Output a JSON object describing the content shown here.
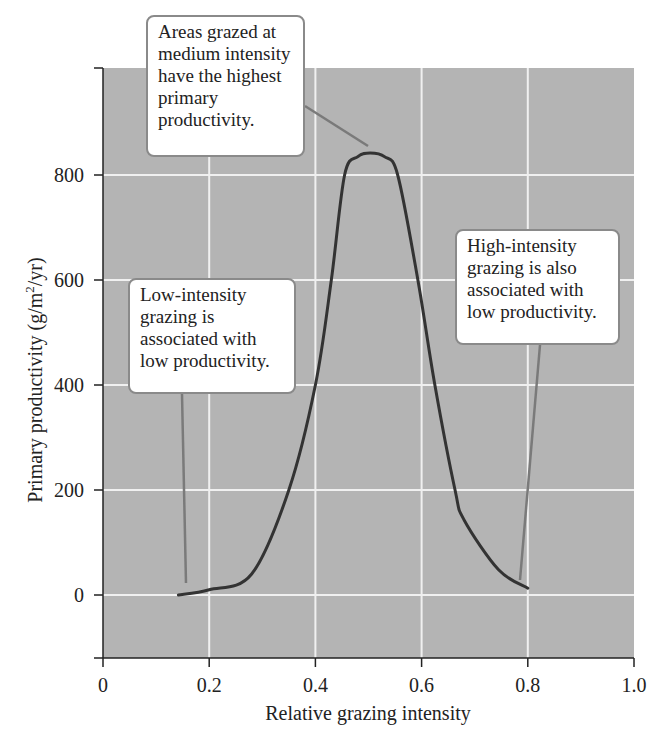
{
  "chart_data": {
    "type": "line",
    "title": "",
    "xlabel": "Relative grazing intensity",
    "ylabel": "Primary productivity (g/m²/yr)",
    "xlim": [
      0,
      1.0
    ],
    "ylim": [
      -120,
      1000
    ],
    "x_ticks": [
      "0",
      "0.2",
      "0.4",
      "0.6",
      "0.8",
      "1.0"
    ],
    "y_ticks": [
      "0",
      "200",
      "400",
      "600",
      "800"
    ],
    "grid": true,
    "background_color": "#b4b4b4",
    "grid_color": "#f0f0f0",
    "line_color": "#333333",
    "series": [
      {
        "name": "Primary productivity",
        "x": [
          0.142,
          0.2,
          0.28,
          0.35,
          0.4,
          0.43,
          0.455,
          0.48,
          0.503,
          0.53,
          0.555,
          0.593,
          0.625,
          0.663,
          0.68,
          0.745,
          0.8
        ],
        "y": [
          0,
          10,
          40,
          200,
          400,
          600,
          800,
          835,
          842,
          835,
          800,
          600,
          400,
          200,
          143,
          48,
          13
        ]
      }
    ],
    "annotations": [
      {
        "id": "peak",
        "lines": [
          "Areas grazed at",
          "medium intensity",
          "have the highest",
          "primary",
          "productivity."
        ],
        "points_to": [
          0.5,
          842
        ]
      },
      {
        "id": "low",
        "lines": [
          "Low-intensity",
          "grazing is",
          "associated with",
          "low productivity."
        ],
        "points_to": [
          0.16,
          20
        ]
      },
      {
        "id": "high",
        "lines": [
          "High-intensity",
          "grazing is also",
          "associated with",
          "low productivity."
        ],
        "points_to": [
          0.79,
          30
        ]
      }
    ]
  }
}
